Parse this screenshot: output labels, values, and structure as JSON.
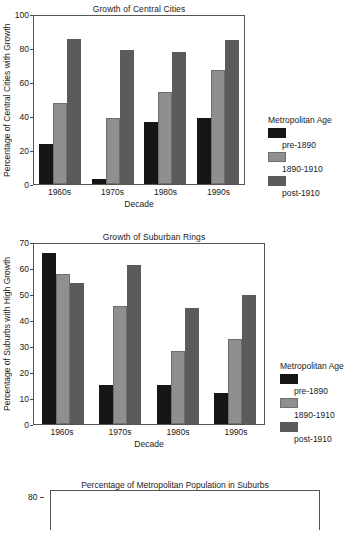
{
  "chart_data": [
    {
      "type": "bar",
      "title": "Growth of Central Cities",
      "xlabel": "Decade",
      "ylabel": "Percentage of Central Cities with Growth",
      "categories": [
        "1960s",
        "1970s",
        "1980s",
        "1990s"
      ],
      "ylim": [
        0,
        100
      ],
      "yticks": [
        0,
        20,
        40,
        60,
        80,
        100
      ],
      "grid": false,
      "legend_position": "right",
      "legend_title": "Metropolitan Age",
      "series": [
        {
          "name": "pre-1890",
          "values": [
            24,
            3,
            37,
            39.5
          ]
        },
        {
          "name": "1890-1910",
          "values": [
            48,
            39,
            54.5,
            68
          ]
        },
        {
          "name": "post-1910",
          "values": [
            86.5,
            79.5,
            78.5,
            86
          ]
        }
      ]
    },
    {
      "type": "bar",
      "title": "Growth of Suburban Rings",
      "xlabel": "Decade",
      "ylabel": "Percentage of Suburbs with High Growth",
      "categories": [
        "1960s",
        "1970s",
        "1980s",
        "1990s"
      ],
      "ylim": [
        0,
        70
      ],
      "yticks": [
        0,
        10,
        20,
        30,
        40,
        50,
        60,
        70
      ],
      "grid": false,
      "legend_position": "right",
      "legend_title": "Metropolitan Age",
      "series": [
        {
          "name": "pre-1890",
          "values": [
            66.5,
            15,
            15,
            12.2
          ]
        },
        {
          "name": "1890-1910",
          "values": [
            58.5,
            45.8,
            28.5,
            33
          ]
        },
        {
          "name": "post-1910",
          "values": [
            55,
            62,
            45.2,
            50.2
          ]
        }
      ]
    },
    {
      "type": "bar",
      "title": "Percentage of Metropolitan Population in Suburbs",
      "xlabel": "",
      "ylabel": "",
      "categories": [],
      "ylim": [
        0,
        80
      ],
      "yticks": [
        80
      ],
      "grid": false,
      "note": "chart clipped at bottom of screenshot; only top frame and the 80 tick are visible",
      "series": []
    }
  ],
  "colors": {
    "series_pre_1890": "#161616",
    "series_1890_1910": "#8f8f8f",
    "series_post_1910": "#5b5b5b",
    "axis": "#555555",
    "background": "#ffffff"
  }
}
